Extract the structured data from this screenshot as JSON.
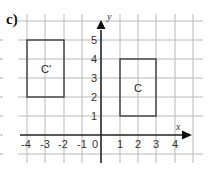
{
  "part_label": "c)",
  "axes": {
    "x_label": "x",
    "y_label": "y",
    "x_ticks": [
      "-4",
      "-3",
      "-2",
      "-1",
      "0",
      "1",
      "2",
      "3",
      "4"
    ],
    "y_ticks": [
      "1",
      "2",
      "3",
      "4",
      "5"
    ]
  },
  "shapes": [
    {
      "name": "C",
      "label": "C",
      "x1": 1,
      "y1": 1,
      "x2": 3,
      "y2": 4
    },
    {
      "name": "C-prime",
      "label": "C′",
      "x1": -4,
      "y1": 2,
      "x2": -2,
      "y2": 5
    }
  ],
  "colors": {
    "grid": "#b8b8b8",
    "axis": "#222222",
    "shape": "#333333"
  }
}
